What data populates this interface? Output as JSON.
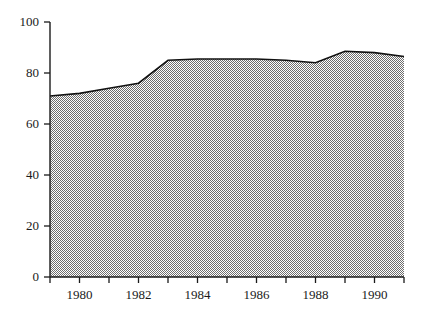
{
  "chart_data": {
    "type": "area",
    "title": "",
    "subtitle": "",
    "xlabel": "",
    "ylabel": "",
    "x": [
      1979,
      1980,
      1981,
      1982,
      1983,
      1984,
      1985,
      1986,
      1987,
      1988,
      1989,
      1990,
      1991
    ],
    "values": [
      71,
      72,
      74,
      76,
      85,
      85.5,
      85.5,
      85.5,
      85,
      84,
      88.5,
      88,
      86.5
    ],
    "series": [
      {
        "name": "Series 1",
        "values": [
          71,
          72,
          74,
          76,
          85,
          85.5,
          85.5,
          85.5,
          85,
          84,
          88.5,
          88,
          86.5
        ]
      }
    ],
    "xlim": [
      1979,
      1991
    ],
    "ylim": [
      0,
      100
    ],
    "ytick_values": [
      0,
      20,
      40,
      60,
      80,
      100
    ],
    "ytick_labels": [
      "0",
      "20",
      "40",
      "60",
      "80",
      "100"
    ],
    "xtick_values": [
      1979,
      1980,
      1981,
      1982,
      1983,
      1984,
      1985,
      1986,
      1987,
      1988,
      1989,
      1990,
      1991
    ],
    "xtick_labels": [
      "",
      "1980",
      "",
      "1982",
      "",
      "1984",
      "",
      "1986",
      "",
      "1988",
      "",
      "1990",
      ""
    ],
    "grid": false,
    "legend": false,
    "legend_position": "none",
    "fill_style": "checkerboard-dither-50",
    "fill_color": "#808080",
    "line_color": "#000000",
    "axis_color": "#1a1a1a",
    "background_color": "#ffffff",
    "annotations": []
  },
  "geometry": {
    "plot_left": 50,
    "plot_right": 404,
    "plot_top": 22,
    "plot_bottom": 277,
    "tick_length": 6
  }
}
